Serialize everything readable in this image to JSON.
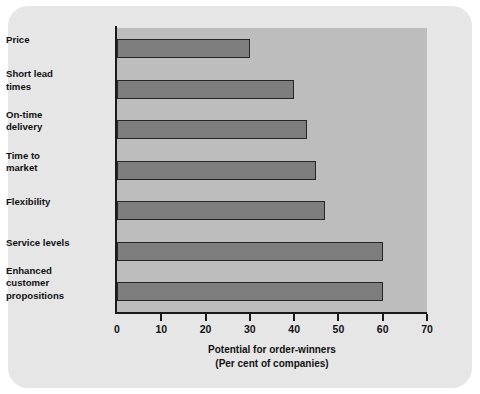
{
  "chart_data": {
    "type": "bar",
    "orientation": "horizontal",
    "title": "",
    "xlabel_line1": "Potential for order-winners",
    "xlabel_line2": "(Per cent of companies)",
    "ylabel": "",
    "xlim": [
      0,
      70
    ],
    "xticks": [
      0,
      10,
      20,
      30,
      40,
      50,
      60,
      70
    ],
    "xtick_labels": [
      "0",
      "10",
      "20",
      "30",
      "40",
      "50",
      "60",
      "70"
    ],
    "grid": false,
    "legend": null,
    "categories": [
      "Price",
      "Short lead times",
      "On-time delivery",
      "Time to market",
      "Flexibility",
      "Service levels",
      "Enhanced customer propositions"
    ],
    "category_label_lines": [
      [
        "Price"
      ],
      [
        "Short lead",
        "times"
      ],
      [
        "On-time",
        "delivery"
      ],
      [
        "Time to",
        "market"
      ],
      [
        "Flexibility"
      ],
      [
        "Service levels"
      ],
      [
        "Enhanced",
        "customer",
        "propositions"
      ]
    ],
    "values": [
      30,
      40,
      43,
      45,
      47,
      60,
      60
    ],
    "colors": {
      "bar_fill": "#7d7d7d",
      "bar_edge": "#262626",
      "plot_background": "#bdbdbd",
      "panel_background": "#e6e6e6",
      "page_background": "#ffffff",
      "axis": "#1a1a1a",
      "text": "#111111"
    }
  }
}
